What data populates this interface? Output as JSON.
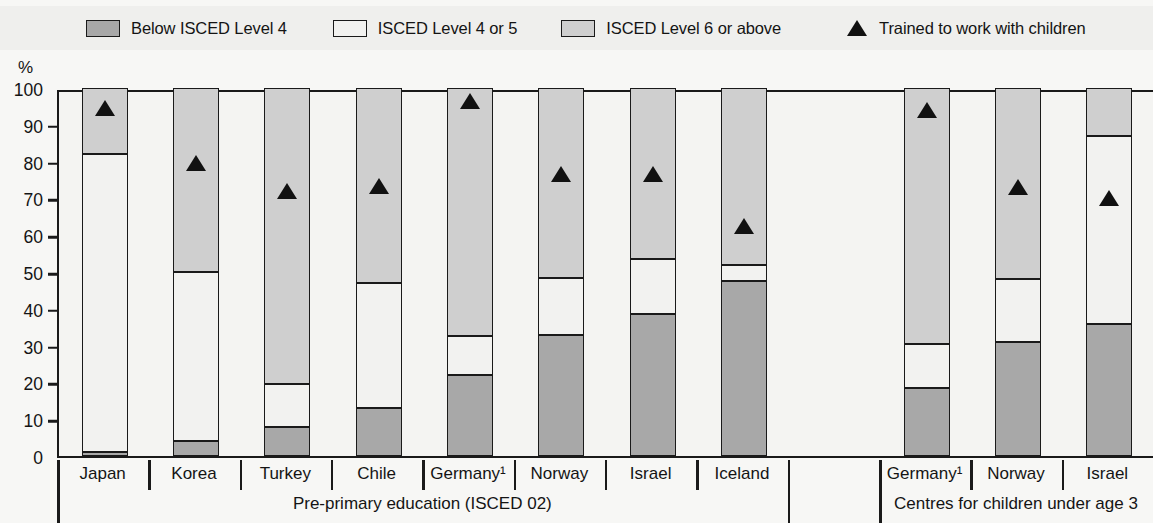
{
  "units_label": "%",
  "legend": {
    "items": [
      {
        "icon": "square-swatch-dark",
        "label": "Below ISCED Level 4",
        "color": "#a8a8a8"
      },
      {
        "icon": "square-swatch-white",
        "label": "ISCED Level 4 or 5",
        "color": "#f2f2f0"
      },
      {
        "icon": "square-swatch-light",
        "label": "ISCED Level 6 or above",
        "color": "#cfcfcf"
      },
      {
        "icon": "triangle-marker",
        "label": "Trained to work with children",
        "color": "#111111"
      }
    ]
  },
  "chart_data": {
    "type": "bar",
    "subtype": "stacked-bar-with-markers",
    "title": "",
    "xlabel": "",
    "ylabel": "%",
    "ylim": [
      0,
      100
    ],
    "yticks": [
      0,
      10,
      20,
      30,
      40,
      50,
      60,
      70,
      80,
      90,
      100
    ],
    "grid": false,
    "legend_position": "top",
    "groups": [
      {
        "name": "Pre-primary education (ISCED 02)",
        "categories": [
          "Japan",
          "Korea",
          "Turkey",
          "Chile",
          "Germany¹",
          "Norway",
          "Israel",
          "Iceland"
        ]
      },
      {
        "name": "Centres for children under age 3",
        "categories": [
          "Germany¹",
          "Norway",
          "Israel"
        ]
      }
    ],
    "categories": [
      "Japan",
      "Korea",
      "Turkey",
      "Chile",
      "Germany¹",
      "Norway",
      "Israel",
      "Iceland",
      "Germany¹",
      "Norway",
      "Israel"
    ],
    "series": [
      {
        "name": "Below ISCED Level 4",
        "values": [
          1,
          4,
          8,
          13,
          22,
          33,
          38.5,
          47.5,
          18.5,
          31,
          36
        ]
      },
      {
        "name": "ISCED Level 4 or 5",
        "values": [
          81,
          46,
          11.5,
          34,
          10.5,
          15.5,
          15,
          4.5,
          12,
          17,
          51
        ]
      },
      {
        "name": "ISCED Level 6 or above",
        "values": [
          18,
          50,
          80.5,
          53,
          67.5,
          51.5,
          46.5,
          48,
          69.5,
          52,
          13
        ]
      }
    ],
    "cumulative_tops": {
      "below_isced_4": [
        1,
        4,
        8,
        13,
        22,
        33,
        38.5,
        47.5,
        18.5,
        31,
        36
      ],
      "isced_4_or_5": [
        82,
        50,
        19.5,
        47,
        32.5,
        48.5,
        53.5,
        52,
        30.5,
        48,
        87
      ]
    },
    "markers": {
      "name": "Trained to work with children",
      "values": [
        94.5,
        79.5,
        72,
        73.5,
        96.5,
        76.5,
        76.5,
        62.5,
        94,
        73,
        70
      ]
    }
  }
}
